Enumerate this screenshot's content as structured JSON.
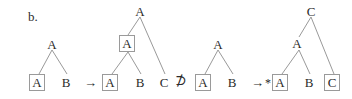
{
  "figure": {
    "section_label": "b.",
    "background_color": "#ffffff",
    "node_box_color": "#9a9a9a",
    "edge_color": "#8d8d8d",
    "text_color": "#2b2b2b",
    "width": 352,
    "height": 99
  },
  "operators": [
    {
      "name": "rewrite-arrow-1",
      "glyph": "→",
      "x": 84,
      "y": 82
    },
    {
      "name": "not-superset",
      "glyph": "⊅",
      "x": 175,
      "y": 80
    },
    {
      "name": "rewrite-arrow-2",
      "glyph": "→",
      "x": 251,
      "y": 82
    },
    {
      "name": "ungrammatical-star",
      "glyph": "*",
      "x": 265,
      "y": 81
    }
  ],
  "trees": [
    {
      "id": "tree-1",
      "root": {
        "label": "A",
        "boxed": false,
        "x": 52,
        "y": 44
      },
      "leaves": [
        {
          "label": "A",
          "boxed": true,
          "x": 37,
          "y": 82
        },
        {
          "label": "B",
          "boxed": false,
          "x": 66,
          "y": 82
        }
      ]
    },
    {
      "id": "tree-2",
      "root": {
        "label": "A",
        "boxed": false,
        "x": 140,
        "y": 11
      },
      "mid": {
        "label": "A",
        "boxed": true,
        "x": 126,
        "y": 43
      },
      "leaves": [
        {
          "label": "A",
          "boxed": true,
          "x": 110,
          "y": 82
        },
        {
          "label": "B",
          "boxed": false,
          "x": 140,
          "y": 82
        },
        {
          "label": "C",
          "boxed": false,
          "x": 164,
          "y": 82
        }
      ]
    },
    {
      "id": "tree-3",
      "root": {
        "label": "A",
        "boxed": false,
        "x": 218,
        "y": 44
      },
      "leaves": [
        {
          "label": "A",
          "boxed": true,
          "x": 203,
          "y": 82
        },
        {
          "label": "B",
          "boxed": false,
          "x": 232,
          "y": 82
        }
      ]
    },
    {
      "id": "tree-4",
      "root": {
        "label": "C",
        "boxed": false,
        "x": 311,
        "y": 11
      },
      "mid": {
        "label": "A",
        "boxed": false,
        "x": 297,
        "y": 43
      },
      "leaves": [
        {
          "label": "A",
          "boxed": true,
          "x": 280,
          "y": 82
        },
        {
          "label": "B",
          "boxed": false,
          "x": 309,
          "y": 82
        },
        {
          "label": "C",
          "boxed": true,
          "x": 332,
          "y": 82
        }
      ]
    }
  ]
}
